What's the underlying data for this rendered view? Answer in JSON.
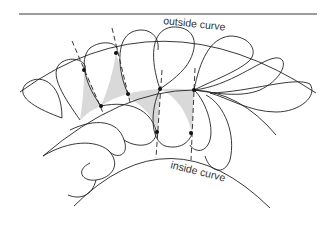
{
  "diagram": {
    "type": "quilting-feather-layout",
    "labels": {
      "outside": "outside curve",
      "inside": "inside curve"
    },
    "colors": {
      "line": "#222222",
      "shade": "#d9d9d9",
      "background": "#ffffff"
    }
  }
}
